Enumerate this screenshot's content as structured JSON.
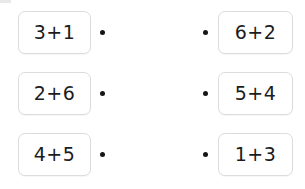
{
  "exercise": {
    "type": "matching-pairs",
    "colors": {
      "card_background": "#ffffff",
      "card_border": "#dcdcdc",
      "text": "#1c1c1c",
      "dot": "#161616",
      "page_background": "#ffffff"
    },
    "rows": [
      {
        "left_expression": "3+1",
        "right_expression": "6+2",
        "left_dot": "connector-dot",
        "right_dot": "connector-dot"
      },
      {
        "left_expression": "2+6",
        "right_expression": "5+4",
        "left_dot": "connector-dot",
        "right_dot": "connector-dot"
      },
      {
        "left_expression": "4+5",
        "right_expression": "1+3",
        "left_dot": "connector-dot",
        "right_dot": "connector-dot"
      }
    ]
  }
}
